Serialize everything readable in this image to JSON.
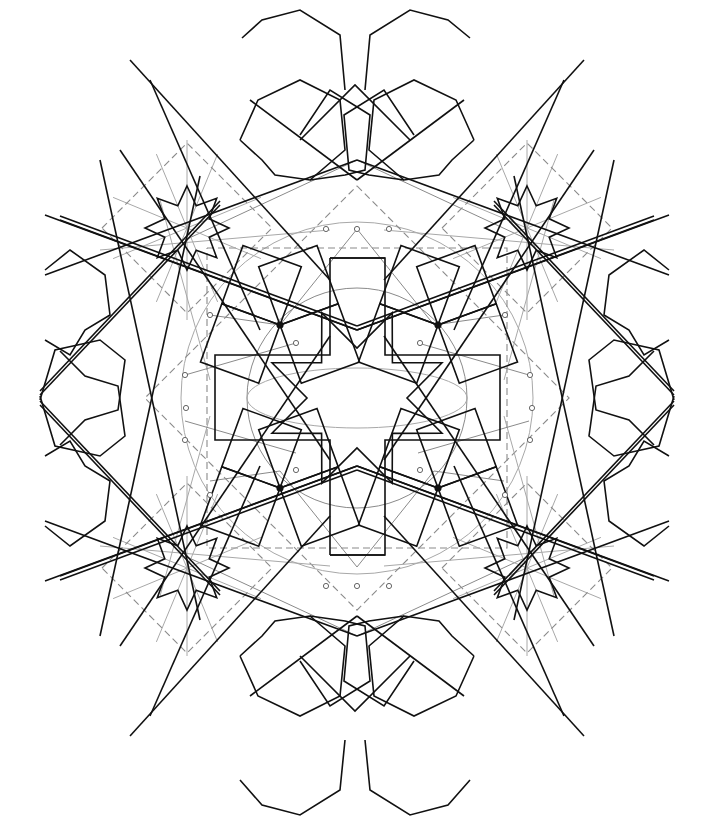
{
  "figure": {
    "width": 702,
    "height": 825,
    "colors": {
      "background": "#ffffff",
      "ink": "#111111",
      "guide": "#8a8a8a",
      "node": "#555555"
    }
  },
  "geometry": {
    "center": [
      357,
      398
    ],
    "inner_circle_r": 110,
    "outer_circle_r": 176,
    "central_star": {
      "points": 8,
      "outer_r": 92,
      "inner_r": 50
    },
    "corner_stars": [
      {
        "cx": 187,
        "cy": 228
      },
      {
        "cx": 527,
        "cy": 228
      },
      {
        "cx": 187,
        "cy": 568
      },
      {
        "cx": 527,
        "cy": 568
      }
    ],
    "corner_star_size": {
      "outer_r": 42,
      "inner_r": 24
    },
    "filled_nodes": [
      [
        280,
        325
      ],
      [
        438,
        325
      ],
      [
        280,
        488
      ],
      [
        438,
        488
      ]
    ],
    "open_nodes": [
      [
        326,
        229
      ],
      [
        357,
        229
      ],
      [
        389,
        229
      ],
      [
        210,
        315
      ],
      [
        505,
        315
      ],
      [
        185,
        375
      ],
      [
        530,
        375
      ],
      [
        186,
        408
      ],
      [
        532,
        408
      ],
      [
        185,
        440
      ],
      [
        530,
        440
      ],
      [
        210,
        495
      ],
      [
        505,
        495
      ],
      [
        326,
        586
      ],
      [
        357,
        586
      ],
      [
        389,
        586
      ],
      [
        296,
        343
      ],
      [
        420,
        343
      ],
      [
        296,
        470
      ],
      [
        420,
        470
      ]
    ]
  }
}
